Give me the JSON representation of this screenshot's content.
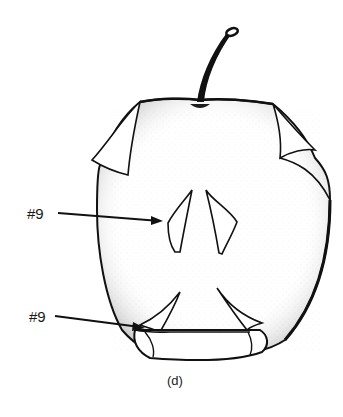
{
  "figure": {
    "caption": "(d)",
    "labels": [
      {
        "text": "#9",
        "target": "seed-cavity-left"
      },
      {
        "text": "#9",
        "target": "lower-left-notch"
      }
    ],
    "colors": {
      "ink": "#111111",
      "background": "#ffffff"
    }
  }
}
